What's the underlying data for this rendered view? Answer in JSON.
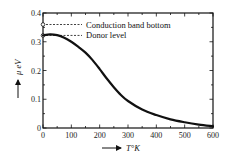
{
  "chart_data": {
    "type": "line",
    "title": "",
    "xlabel": "T°K",
    "ylabel": "μ eV",
    "xlim": [
      0,
      600
    ],
    "ylim": [
      0,
      0.4
    ],
    "x_ticks": [
      0,
      100,
      200,
      300,
      400,
      500,
      600
    ],
    "x_tick_labels": [
      "0",
      "100",
      "200",
      "300",
      "400",
      "500",
      "600"
    ],
    "y_ticks": [
      0,
      0.1,
      0.2,
      0.3,
      0.4
    ],
    "y_tick_labels": [
      "0",
      "0.1",
      "0.2",
      "0.3",
      "0.4"
    ],
    "grid": false,
    "legend": null,
    "series": [
      {
        "name": "μ (chemical potential)",
        "x": [
          0,
          25,
          50,
          75,
          100,
          125,
          150,
          175,
          200,
          225,
          250,
          275,
          300,
          350,
          400,
          450,
          500,
          550,
          600
        ],
        "values": [
          0.322,
          0.326,
          0.323,
          0.314,
          0.3,
          0.282,
          0.262,
          0.236,
          0.205,
          0.172,
          0.142,
          0.115,
          0.094,
          0.064,
          0.045,
          0.03,
          0.02,
          0.012,
          0.006
        ]
      }
    ],
    "annotations": [
      {
        "text": "Conduction band bottom",
        "y": 0.36,
        "style": "dashed",
        "marker": "open-circle"
      },
      {
        "text": "Donor level",
        "y": 0.322,
        "style": "dashed",
        "marker": "open-circle"
      }
    ]
  },
  "labels": {
    "conduction": "Conduction band bottom",
    "donor": "Donor level",
    "xlabel": "T°K",
    "ylabel": "μ eV"
  }
}
